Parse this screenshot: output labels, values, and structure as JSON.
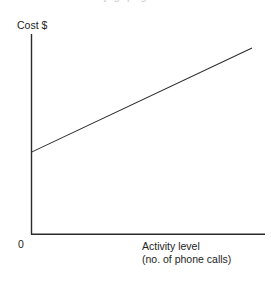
{
  "figure": {
    "background_color": "#ffffff",
    "line_color": "#2b2b2b",
    "text_color": "#232323",
    "clipped_title_fragment": "   j  g   p    g  "
  },
  "labels": {
    "y_axis_title": "Cost $",
    "origin": "0",
    "x_axis_title_line1": "Activity level",
    "x_axis_title_line2": "(no. of phone calls)"
  },
  "chart_data": {
    "type": "line",
    "title": "",
    "subtitle": "",
    "xlabel": "Activity level (no. of phone calls)",
    "ylabel": "Cost $",
    "grid": false,
    "legend": null,
    "legend_position": "none",
    "xlim": [
      0,
      100
    ],
    "ylim": [
      0,
      100
    ],
    "xticks": [
      0
    ],
    "xticklabels": [
      "0"
    ],
    "yticks": [],
    "yticklabels": [],
    "axis_style": "two-spine open L (no arrowheads, no tick marks)",
    "series": [
      {
        "name": "Semi-variable cost",
        "type": "line",
        "x": [
          0,
          100
        ],
        "y": [
          41,
          93
        ],
        "intercept": 41,
        "slope": 0.52,
        "description": "Straight upward-sloping line beginning above the origin (fixed cost component) and rising steadily with activity level (variable cost component)"
      }
    ],
    "annotations": []
  }
}
